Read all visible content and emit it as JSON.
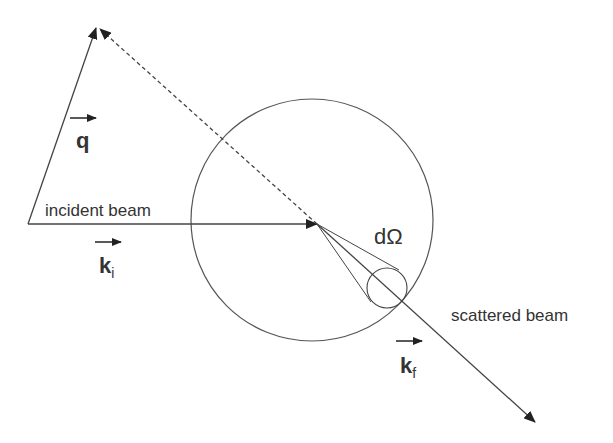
{
  "diagram": {
    "type": "scattering-geometry",
    "colors": {
      "line": "#444444",
      "text": "#333333",
      "background": "#ffffff"
    },
    "sample_sphere": {
      "cx": 312,
      "cy": 220,
      "r": 121
    },
    "scattering_point": {
      "x": 317,
      "y": 224
    },
    "detector_circle": {
      "cx": 387,
      "cy": 288,
      "r": 20
    },
    "vectors": [
      {
        "id": "k_i",
        "from": [
          28,
          224
        ],
        "to": [
          317,
          224
        ],
        "style": "solid",
        "role": "incident wavevector"
      },
      {
        "id": "k_f",
        "from": [
          317,
          224
        ],
        "to": [
          535,
          422
        ],
        "style": "solid",
        "role": "scattered wavevector"
      },
      {
        "id": "q",
        "from": [
          28,
          224
        ],
        "to": [
          97,
          27
        ],
        "style": "solid",
        "role": "scattering vector"
      },
      {
        "id": "k_i_reversed",
        "from": [
          317,
          224
        ],
        "to": [
          99,
          28
        ],
        "style": "dashed",
        "role": "negative k_f construction"
      }
    ],
    "labels": {
      "incident_beam": "incident beam",
      "scattered_beam": "scattered beam",
      "solid_angle": "dΩ",
      "q_main": "q",
      "ki_main": "k",
      "ki_sub": "i",
      "kf_main": "k",
      "kf_sub": "f"
    }
  }
}
